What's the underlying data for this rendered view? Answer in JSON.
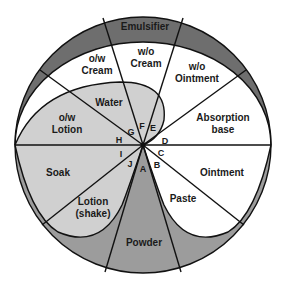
{
  "colors": {
    "outer_ring": "#6e6e6e",
    "light_gray": "#d0d0d0",
    "medium_gray": "#9c9c9c",
    "white": "#ffffff",
    "stroke": "#111111"
  },
  "ring_label": "Emulsifier",
  "regions": {
    "ow_cream": [
      "o/w",
      "Cream"
    ],
    "wo_cream": [
      "w/o",
      "Cream"
    ],
    "wo_ointment": [
      "w/o",
      "Ointment"
    ],
    "water": "Water",
    "ow_lotion": [
      "o/w",
      "Lotion"
    ],
    "absorption_base": [
      "Absorption",
      "base"
    ],
    "soak": "Soak",
    "ointment": "Ointment",
    "lotion_shake": [
      "Lotion",
      "(shake)"
    ],
    "paste": "Paste",
    "powder": "Powder"
  },
  "points": {
    "A": "A",
    "B": "B",
    "C": "C",
    "D": "D",
    "E": "E",
    "F": "F",
    "G": "G",
    "H": "H",
    "I": "I",
    "J": "J"
  }
}
